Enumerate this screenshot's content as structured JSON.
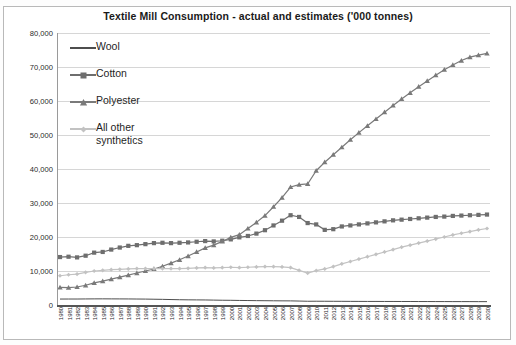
{
  "chart_data": {
    "type": "line",
    "title": "Textile Mill Consumption - actual and estimates ('000 tonnes)",
    "xlabel": "",
    "ylabel": "",
    "ylim": [
      0,
      80000
    ],
    "ytick_labels": [
      "0",
      "10,000",
      "20,000",
      "30,000",
      "40,000",
      "50,000",
      "60,000",
      "70,000",
      "80,000"
    ],
    "ytick_values": [
      0,
      10000,
      20000,
      30000,
      40000,
      50000,
      60000,
      70000,
      80000
    ],
    "grid": true,
    "legend_position": "upper-left-inside",
    "x": [
      1980,
      1981,
      1982,
      1983,
      1984,
      1985,
      1986,
      1987,
      1988,
      1989,
      1990,
      1991,
      1992,
      1993,
      1994,
      1995,
      1996,
      1997,
      1998,
      1999,
      2000,
      2001,
      2002,
      2003,
      2004,
      2005,
      2006,
      2007,
      2008,
      2009,
      2010,
      2011,
      2012,
      2013,
      2014,
      2015,
      2016,
      2017,
      2018,
      2019,
      2020,
      2021,
      2022,
      2023,
      2024,
      2025,
      2026,
      2027,
      2028,
      2029,
      2030
    ],
    "series": [
      {
        "name": "Wool",
        "color": "#4d4d4d",
        "marker": "none",
        "values": [
          1750,
          1760,
          1760,
          1780,
          1800,
          1810,
          1800,
          1790,
          1780,
          1760,
          1740,
          1700,
          1660,
          1600,
          1550,
          1520,
          1500,
          1480,
          1440,
          1400,
          1380,
          1340,
          1310,
          1280,
          1260,
          1240,
          1220,
          1210,
          1160,
          1100,
          1110,
          1100,
          1090,
          1080,
          1070,
          1060,
          1050,
          1050,
          1040,
          1040,
          1030,
          1030,
          1020,
          1020,
          1010,
          1010,
          1000,
          1000,
          1000,
          990,
          990
        ]
      },
      {
        "name": "Cotton",
        "color": "#6e6e6e",
        "marker": "square",
        "values": [
          14100,
          14200,
          14000,
          14500,
          15400,
          15600,
          16300,
          16900,
          17400,
          17600,
          17900,
          18200,
          18300,
          18200,
          18300,
          18400,
          18600,
          18800,
          18700,
          18900,
          19300,
          19900,
          20300,
          21000,
          22000,
          23400,
          24800,
          26400,
          25900,
          24100,
          23700,
          22100,
          22300,
          23100,
          23400,
          23700,
          24000,
          24300,
          24600,
          24900,
          25100,
          25300,
          25500,
          25700,
          25900,
          26000,
          26200,
          26300,
          26400,
          26500,
          26600
        ]
      },
      {
        "name": "Polyester",
        "color": "#7a7a7a",
        "marker": "triangle",
        "values": [
          5200,
          5100,
          5300,
          5800,
          6500,
          7000,
          7600,
          8200,
          8800,
          9400,
          10000,
          10600,
          11400,
          12300,
          13300,
          14400,
          15600,
          16800,
          17600,
          18700,
          19900,
          20700,
          22500,
          24300,
          26300,
          28900,
          31600,
          34700,
          35400,
          35600,
          39500,
          42000,
          44200,
          46400,
          48600,
          50700,
          52700,
          54700,
          56700,
          58700,
          60600,
          62400,
          64200,
          65900,
          67600,
          69200,
          70600,
          71900,
          72900,
          73500,
          74000
        ]
      },
      {
        "name": "All other synthetics",
        "color": "#c2c2c2",
        "marker": "diamond",
        "values": [
          8600,
          8900,
          9100,
          9600,
          10000,
          10200,
          10400,
          10500,
          10600,
          10700,
          10700,
          10700,
          10700,
          10700,
          10700,
          10800,
          10900,
          11000,
          10900,
          11000,
          11100,
          11000,
          11100,
          11200,
          11300,
          11300,
          11200,
          11000,
          10200,
          9400,
          10100,
          10600,
          11300,
          12100,
          12800,
          13500,
          14200,
          14900,
          15600,
          16300,
          17000,
          17600,
          18200,
          18800,
          19400,
          20000,
          20600,
          21100,
          21600,
          22100,
          22500
        ]
      }
    ]
  },
  "legend": {
    "items": [
      {
        "label": "Wool"
      },
      {
        "label": "Cotton"
      },
      {
        "label": "Polyester"
      },
      {
        "label": "All other",
        "label2": "synthetics"
      }
    ]
  }
}
